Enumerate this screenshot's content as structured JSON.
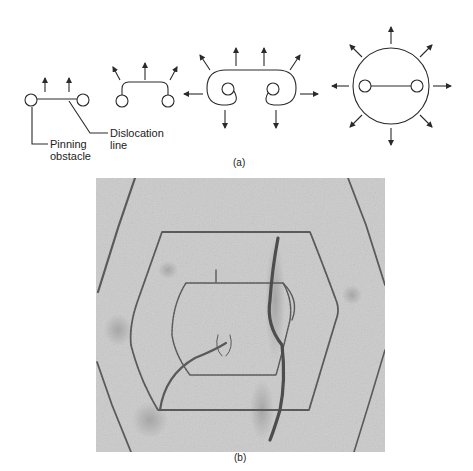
{
  "figure": {
    "panel_a": {
      "caption": "(a)",
      "stages": [
        {
          "id": 1,
          "description": "Straight dislocation line pinned between two obstacles, bowing forces (2 arrows)"
        },
        {
          "id": 2,
          "description": "Dislocation bows out between pinning points (3 arrows)"
        },
        {
          "id": 3,
          "description": "Bowed loop wraps around obstacles, curling segments about to meet (8 arrows)"
        },
        {
          "id": 4,
          "description": "Closed loop expands outward, new line regenerated between obstacles (8 arrows)"
        }
      ],
      "labels": {
        "pinning_line1": "Pinning",
        "pinning_line2": "obstacle",
        "dislocation_line1": "Dislocation",
        "dislocation_line2": "line"
      }
    },
    "panel_b": {
      "caption": "(b)",
      "description": "Electron micrograph of concentric hexagonal dislocation loops from a Frank-Read source"
    },
    "colors": {
      "line": "#2a2a2a",
      "micrograph_bg": "#c9c9c9",
      "micrograph_line": "#5a5a5a"
    }
  }
}
